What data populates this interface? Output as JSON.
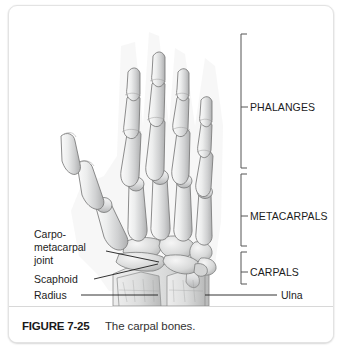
{
  "figure": {
    "number": "FIGURE 7-25",
    "caption": "The carpal bones."
  },
  "left_labels": [
    {
      "id": "carpometacarpal-joint",
      "lines": [
        "Carpo-",
        "metacarpal",
        "joint"
      ]
    },
    {
      "id": "scaphoid",
      "lines": [
        "Scaphoid"
      ]
    },
    {
      "id": "radius",
      "lines": [
        "Radius"
      ]
    }
  ],
  "right_labels": [
    {
      "id": "phalanges",
      "text": "PHALANGES"
    },
    {
      "id": "metacarpals",
      "text": "METACARPALS"
    },
    {
      "id": "carpals",
      "text": "CARPALS"
    }
  ],
  "bottom_right_label": {
    "id": "ulna",
    "text": "Ulna"
  },
  "colors": {
    "card_background": "#ffffff",
    "card_border": "#e3e3e3",
    "caption_rule": "#d8d8d8",
    "label_text": "#1c1c1c",
    "caption_number": "#1a1a1a",
    "caption_body": "#333333",
    "bracket_line": "#555555",
    "leader_line": "#1c1c1c",
    "bone_fill_light": "#f2f2f2",
    "bone_fill_mid": "#d2d2d2",
    "bone_fill_shadow": "#a8a8a8",
    "bone_outline": "#6f6f6f"
  }
}
